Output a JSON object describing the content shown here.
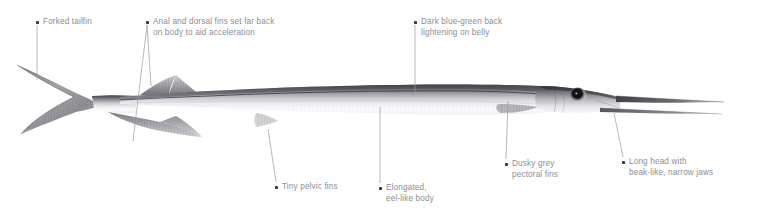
{
  "figure": {
    "background_color": "#ffffff",
    "label_text_color": "#8d8d92",
    "bullet_color": "#3b3b40",
    "leader_line_color": "#9a9a9f",
    "illustration_dark_tone": "#4a4a4e",
    "illustration_mid_tone": "#9d9da2",
    "illustration_light_tone": "#fbfbfb"
  },
  "callouts": [
    {
      "id": "forked-tailfin",
      "text": "Forked tailfin",
      "bullet_x": 36,
      "bullet_y": 21,
      "text_x": 43,
      "text_y": 16
    },
    {
      "id": "anal-and-dorsal-fins",
      "text": "Anal and dorsal fins set far back\non body to aid acceleration",
      "bullet_x": 146,
      "bullet_y": 21,
      "text_x": 153,
      "text_y": 16
    },
    {
      "id": "dark-blue-green-back",
      "text": "Dark blue-green back\nlightening on belly",
      "bullet_x": 414,
      "bullet_y": 21,
      "text_x": 421,
      "text_y": 16
    },
    {
      "id": "tiny-pelvic-fins",
      "text": "Tiny pelvic fins",
      "bullet_x": 275,
      "bullet_y": 186,
      "text_x": 282,
      "text_y": 181
    },
    {
      "id": "elongated-eel-like-body",
      "text": "Elongated,\neel-like body",
      "bullet_x": 379,
      "bullet_y": 187,
      "text_x": 386,
      "text_y": 182
    },
    {
      "id": "dusky-grey-pectoral-fins",
      "text": "Dusky grey\npectoral fins",
      "bullet_x": 505,
      "bullet_y": 163,
      "text_x": 512,
      "text_y": 158
    },
    {
      "id": "long-head-with-beak",
      "text": "Long head with\nbeak-like, narrow jaws",
      "bullet_x": 622,
      "bullet_y": 161,
      "text_x": 629,
      "text_y": 156
    }
  ],
  "leader_lines": [
    {
      "id": "leader-forked-tailfin",
      "x1": 37,
      "y1": 25,
      "x2": 37,
      "y2": 80
    },
    {
      "id": "leader-dorsal-fin",
      "x1": 147,
      "y1": 25,
      "x2": 151,
      "y2": 86
    },
    {
      "id": "leader-anal-fin",
      "x1": 147,
      "y1": 25,
      "x2": 133,
      "y2": 141
    },
    {
      "id": "leader-back-colour",
      "x1": 415,
      "y1": 25,
      "x2": 415,
      "y2": 92
    },
    {
      "id": "leader-pelvic-fin",
      "x1": 276,
      "y1": 182,
      "x2": 268,
      "y2": 129
    },
    {
      "id": "leader-body",
      "x1": 380,
      "y1": 183,
      "x2": 380,
      "y2": 107
    },
    {
      "id": "leader-pectoral-fin",
      "x1": 506,
      "y1": 159,
      "x2": 508,
      "y2": 101
    },
    {
      "id": "leader-head",
      "x1": 623,
      "y1": 157,
      "x2": 614,
      "y2": 113
    }
  ]
}
